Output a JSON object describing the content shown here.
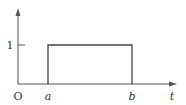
{
  "diagram": {
    "type": "rectangular-pulse",
    "axes": {
      "x_label": "t",
      "origin_label": "O",
      "y_tick_label": "1"
    },
    "pulse": {
      "start_label": "a",
      "end_label": "b",
      "height": 1
    },
    "colors": {
      "axis": "#555555",
      "pulse": "#444444",
      "text": "#333333",
      "background": "#ffffff"
    }
  }
}
